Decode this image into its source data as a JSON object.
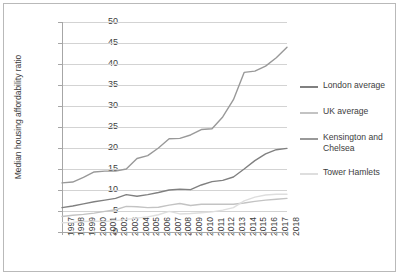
{
  "chart_data": {
    "type": "line",
    "title": "",
    "xlabel": "",
    "ylabel": "Median housing affordability ratio",
    "ylim": [
      0,
      50
    ],
    "ytick_step": 5,
    "yticks": [
      50,
      45,
      40,
      35,
      30,
      25,
      20,
      15,
      10,
      5,
      0
    ],
    "grid": true,
    "legend_position": "right",
    "x": [
      1997,
      1998,
      1999,
      2000,
      2001,
      2002,
      2003,
      2004,
      2005,
      2006,
      2007,
      2008,
      2009,
      2010,
      2011,
      2012,
      2013,
      2014,
      2015,
      2016,
      2017,
      2018
    ],
    "categories": [
      "1997",
      "1998",
      "1999",
      "2000",
      "2001",
      "2002",
      "2003",
      "2004",
      "2005",
      "2006",
      "2007",
      "2008",
      "2009",
      "2010",
      "2011",
      "2012",
      "2013",
      "2014",
      "2015",
      "2016",
      "2017",
      "2018"
    ],
    "series": [
      {
        "name": "London average",
        "color": "#808080",
        "values": [
          5.8,
          6.2,
          6.7,
          7.2,
          7.6,
          8.0,
          8.9,
          8.5,
          8.9,
          9.4,
          10.0,
          10.2,
          10.1,
          11.2,
          12.0,
          12.3,
          13.1,
          15.0,
          17.0,
          18.6,
          19.6,
          19.9
        ]
      },
      {
        "name": "UK average",
        "color": "#c3c3c3",
        "values": [
          3.7,
          4.0,
          4.2,
          4.5,
          4.9,
          5.3,
          6.1,
          6.0,
          5.8,
          5.9,
          6.4,
          6.8,
          6.3,
          6.6,
          6.6,
          6.6,
          6.6,
          6.9,
          7.3,
          7.6,
          7.8,
          8.0
        ]
      },
      {
        "name": "Kensington and Chelsea",
        "color": "#999999",
        "values": [
          11.7,
          11.9,
          13.0,
          14.3,
          14.5,
          14.5,
          15.0,
          17.5,
          18.2,
          20.0,
          22.2,
          22.3,
          23.1,
          24.4,
          24.6,
          27.4,
          31.5,
          38.0,
          38.3,
          39.5,
          41.5,
          44.0
        ]
      },
      {
        "name": "Tower Hamlets",
        "color": "#dedede",
        "values": [
          2.2,
          2.3,
          2.5,
          2.6,
          2.5,
          2.7,
          3.0,
          3.3,
          3.6,
          4.1,
          4.9,
          4.3,
          4.4,
          4.6,
          4.8,
          5.2,
          5.8,
          7.4,
          8.3,
          8.8,
          9.0,
          9.0
        ]
      }
    ]
  },
  "legend": {
    "items": [
      {
        "label": "London average"
      },
      {
        "label": "UK average"
      },
      {
        "label": "Kensington and Chelsea"
      },
      {
        "label": "Tower Hamlets"
      }
    ]
  }
}
